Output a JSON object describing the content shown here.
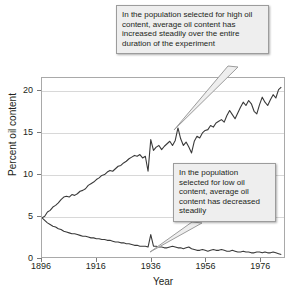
{
  "chart_data": {
    "type": "line",
    "title": "",
    "xlabel": "Year",
    "ylabel": "Percent oil content",
    "xlim": [
      1896,
      1985
    ],
    "ylim": [
      0,
      21.5
    ],
    "grid": true,
    "legend": "none",
    "xticks": [
      1896,
      1916,
      1936,
      1956,
      1976
    ],
    "xtick_labels": [
      "1896",
      "1916",
      "1936",
      "1956",
      "1976"
    ],
    "yticks": [
      0,
      5,
      10,
      15,
      20
    ],
    "ytick_labels": [
      "0",
      "5",
      "10",
      "15",
      "20"
    ],
    "line_color": "#3a3a3a",
    "grid_color": "#d8d8d8",
    "axis_color": "#a9a9a9",
    "series": [
      {
        "name": "Selected for high oil content",
        "color": "#3a3a3a",
        "x": [
          1896,
          1897,
          1898,
          1899,
          1900,
          1901,
          1902,
          1903,
          1904,
          1905,
          1906,
          1907,
          1908,
          1909,
          1910,
          1911,
          1912,
          1913,
          1914,
          1915,
          1916,
          1917,
          1918,
          1919,
          1920,
          1921,
          1922,
          1923,
          1924,
          1925,
          1926,
          1927,
          1928,
          1929,
          1930,
          1931,
          1932,
          1933,
          1934,
          1935,
          1936,
          1937,
          1938,
          1939,
          1940,
          1941,
          1942,
          1943,
          1944,
          1945,
          1946,
          1947,
          1948,
          1949,
          1950,
          1951,
          1952,
          1953,
          1954,
          1955,
          1956,
          1957,
          1958,
          1959,
          1960,
          1961,
          1962,
          1963,
          1964,
          1965,
          1966,
          1967,
          1968,
          1969,
          1970,
          1971,
          1972,
          1973,
          1974,
          1975,
          1976,
          1977,
          1978,
          1979,
          1980,
          1981,
          1982,
          1983,
          1984
        ],
        "values": [
          4.7,
          4.9,
          5.4,
          5.6,
          6.0,
          6.2,
          6.5,
          6.9,
          7.2,
          7.3,
          7.2,
          7.5,
          7.4,
          7.6,
          7.9,
          8.0,
          8.2,
          8.6,
          8.8,
          9.0,
          9.3,
          9.5,
          9.8,
          9.9,
          10.2,
          10.4,
          10.3,
          10.6,
          10.9,
          11.0,
          11.3,
          11.5,
          11.8,
          12.0,
          12.2,
          12.1,
          12.3,
          11.9,
          12.1,
          10.3,
          14.1,
          12.8,
          13.2,
          13.4,
          12.9,
          13.3,
          13.6,
          13.9,
          13.4,
          14.0,
          15.5,
          14.2,
          13.4,
          13.8,
          13.2,
          12.5,
          13.9,
          14.5,
          14.3,
          14.9,
          15.2,
          15.3,
          15.8,
          15.6,
          16.1,
          16.3,
          16.5,
          16.2,
          17.0,
          17.6,
          17.1,
          16.6,
          17.3,
          18.0,
          18.6,
          18.2,
          18.8,
          18.4,
          17.5,
          17.2,
          18.3,
          19.2,
          18.6,
          18.2,
          18.9,
          19.5,
          19.1,
          20.1,
          20.4
        ]
      },
      {
        "name": "Selected for low oil content",
        "color": "#3a3a3a",
        "x": [
          1896,
          1897,
          1898,
          1899,
          1900,
          1901,
          1902,
          1903,
          1904,
          1905,
          1906,
          1907,
          1908,
          1909,
          1910,
          1911,
          1912,
          1913,
          1914,
          1915,
          1916,
          1917,
          1918,
          1919,
          1920,
          1921,
          1922,
          1923,
          1924,
          1925,
          1926,
          1927,
          1928,
          1929,
          1930,
          1931,
          1932,
          1933,
          1934,
          1935,
          1936,
          1937,
          1938,
          1939,
          1940,
          1941,
          1942,
          1943,
          1944,
          1945,
          1946,
          1947,
          1948,
          1949,
          1950,
          1951,
          1952,
          1953,
          1954,
          1955,
          1956,
          1957,
          1958,
          1959,
          1960,
          1961,
          1962,
          1963,
          1964,
          1965,
          1966,
          1967,
          1968,
          1969,
          1970,
          1971,
          1972,
          1973,
          1974,
          1975,
          1976,
          1977,
          1978,
          1979,
          1980,
          1981,
          1982,
          1983,
          1984
        ],
        "values": [
          4.7,
          4.4,
          4.1,
          3.9,
          3.7,
          3.6,
          3.4,
          3.3,
          3.1,
          3.0,
          2.9,
          2.8,
          2.8,
          2.7,
          2.6,
          2.5,
          2.5,
          2.4,
          2.3,
          2.3,
          2.2,
          2.2,
          2.1,
          2.1,
          2.0,
          2.0,
          1.9,
          1.8,
          1.8,
          1.7,
          1.7,
          1.6,
          1.6,
          1.5,
          1.4,
          1.4,
          1.3,
          1.3,
          1.3,
          1.2,
          2.7,
          1.3,
          1.3,
          1.2,
          1.2,
          1.1,
          1.1,
          1.2,
          1.3,
          1.2,
          1.1,
          1.1,
          1.0,
          1.1,
          1.2,
          1.0,
          0.9,
          0.8,
          0.8,
          0.9,
          0.8,
          0.7,
          0.8,
          0.9,
          0.8,
          0.8,
          0.9,
          0.8,
          0.7,
          0.7,
          0.8,
          0.7,
          0.6,
          0.6,
          0.7,
          0.6,
          0.6,
          0.5,
          0.5,
          0.6,
          0.6,
          0.5,
          0.6,
          0.5,
          0.5,
          0.6,
          0.5,
          0.4,
          0.3
        ]
      }
    ],
    "annotations": [
      {
        "id": "callout-high",
        "text": "In the population selected for high oil content, average oil content has increased steadily over the entire duration of the experiment",
        "points_to_series": "Selected for high oil content",
        "points_to_year": 1957
      },
      {
        "id": "callout-low",
        "text": "In the population selected for low oil content, average oil content has decreased steadily",
        "points_to_series": "Selected for low oil content",
        "points_to_year": 1954
      }
    ]
  }
}
